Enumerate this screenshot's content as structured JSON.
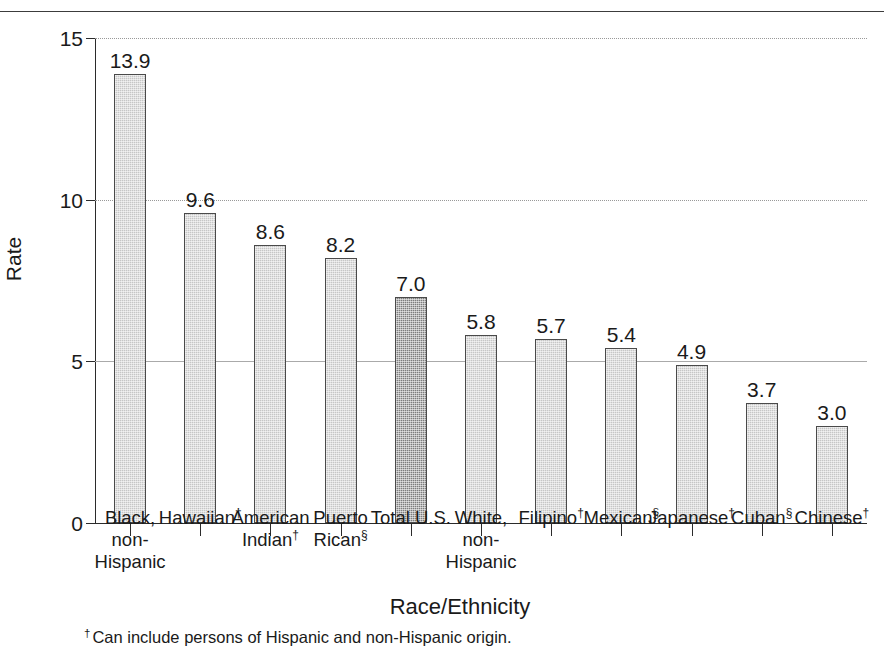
{
  "figure": {
    "top_rule": true
  },
  "chart_data": {
    "type": "bar",
    "title": "",
    "xlabel": "Race/Ethnicity",
    "ylabel": "Rate",
    "ylim": [
      0,
      15
    ],
    "yticks": [
      0,
      5,
      10,
      15
    ],
    "ytick_labels": [
      "0",
      "5",
      "10",
      "15"
    ],
    "grid": "horizontal",
    "legend": "none",
    "categories": [
      "Black, non-Hispanic",
      "Hawaiian†",
      "American Indian†",
      "Puerto Rican§",
      "Total U.S.",
      "White, non-Hispanic",
      "Filipino†",
      "Mexican§",
      "Japanese†",
      "Cuban§",
      "Chinese†"
    ],
    "values": [
      13.9,
      9.6,
      8.6,
      8.2,
      7.0,
      5.8,
      5.7,
      5.4,
      4.9,
      3.7,
      3.0
    ],
    "value_labels": [
      "13.9",
      "9.6",
      "8.6",
      "8.2",
      "7.0",
      "5.8",
      "5.7",
      "5.4",
      "4.9",
      "3.7",
      "3.0"
    ],
    "bars": [
      {
        "label_lines": [
          {
            "text": "Black,",
            "sup": ""
          },
          {
            "text": "non-",
            "sup": ""
          },
          {
            "text": "Hispanic",
            "sup": ""
          }
        ],
        "value": 13.9,
        "value_label": "13.9",
        "highlight": false
      },
      {
        "label_lines": [
          {
            "text": "Hawaiian",
            "sup": "†"
          }
        ],
        "value": 9.6,
        "value_label": "9.6",
        "highlight": false
      },
      {
        "label_lines": [
          {
            "text": "American",
            "sup": ""
          },
          {
            "text": "Indian",
            "sup": "†"
          }
        ],
        "value": 8.6,
        "value_label": "8.6",
        "highlight": false
      },
      {
        "label_lines": [
          {
            "text": "Puerto",
            "sup": ""
          },
          {
            "text": "Rican",
            "sup": "§"
          }
        ],
        "value": 8.2,
        "value_label": "8.2",
        "highlight": false
      },
      {
        "label_lines": [
          {
            "text": "Total U.S.",
            "sup": ""
          }
        ],
        "value": 7.0,
        "value_label": "7.0",
        "highlight": true
      },
      {
        "label_lines": [
          {
            "text": "White,",
            "sup": ""
          },
          {
            "text": "non-",
            "sup": ""
          },
          {
            "text": "Hispanic",
            "sup": ""
          }
        ],
        "value": 5.8,
        "value_label": "5.8",
        "highlight": false
      },
      {
        "label_lines": [
          {
            "text": "Filipino",
            "sup": "†"
          }
        ],
        "value": 5.7,
        "value_label": "5.7",
        "highlight": false
      },
      {
        "label_lines": [
          {
            "text": "Mexican",
            "sup": "§"
          }
        ],
        "value": 5.4,
        "value_label": "5.4",
        "highlight": false
      },
      {
        "label_lines": [
          {
            "text": "Japanese",
            "sup": "†"
          }
        ],
        "value": 4.9,
        "value_label": "4.9",
        "highlight": false
      },
      {
        "label_lines": [
          {
            "text": "Cuban",
            "sup": "§"
          }
        ],
        "value": 3.7,
        "value_label": "3.7",
        "highlight": false
      },
      {
        "label_lines": [
          {
            "text": "Chinese",
            "sup": "†"
          }
        ],
        "value": 3.0,
        "value_label": "3.0",
        "highlight": false
      }
    ],
    "colors": {
      "bar_fill": "#c6c6c6",
      "bar_highlight_fill": "#7d7d7d",
      "bar_edge": "#4a4a4a",
      "axis": "#2b2b2b",
      "grid": "#aaaaaa",
      "text": "#1a1a1a"
    }
  },
  "footnote": {
    "marker": "†",
    "text": "Can include persons of Hispanic and non-Hispanic origin."
  }
}
